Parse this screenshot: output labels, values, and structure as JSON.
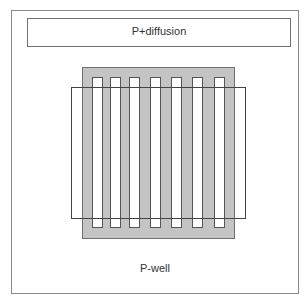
{
  "diagram": {
    "outer_region_label": "P-well",
    "top_region_label": "P+diffusion",
    "stripe_count": 7,
    "colors": {
      "gate_fill": "#c4c4c4",
      "stripe_fill": "#ffffff",
      "outline": "#707070"
    }
  }
}
